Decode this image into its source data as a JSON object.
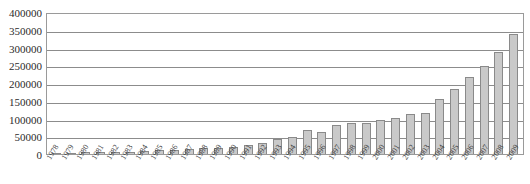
{
  "chart_data": {
    "type": "bar",
    "title": "",
    "xlabel": "",
    "ylabel": "",
    "ylim": [
      0,
      400000
    ],
    "ytick_step": 50000,
    "yticks": [
      "400000",
      "350000",
      "300000",
      "250000",
      "200000",
      "150000",
      "100000",
      "50000",
      "0"
    ],
    "grid": true,
    "legend": "none",
    "bar_color": "#c9c9c9",
    "bar_border_color": "#8a8a8a",
    "gridline_color": "#8c8c8c",
    "axis_color": "#9a9a9a",
    "categories": [
      "1978",
      "1979",
      "1980",
      "1981",
      "1982",
      "1983",
      "1984",
      "1985",
      "1986",
      "1987",
      "1988",
      "1989",
      "1990",
      "1991",
      "1992",
      "1993",
      "1994",
      "1995",
      "1996",
      "1997",
      "1998",
      "1999",
      "2000",
      "2001",
      "2002",
      "2003",
      "2004",
      "2005",
      "2006",
      "2007",
      "2008",
      "2009"
    ],
    "values": [
      3000,
      4000,
      6000,
      5000,
      7000,
      6000,
      9000,
      11000,
      10000,
      13000,
      17000,
      16000,
      21000,
      26000,
      32000,
      43000,
      49000,
      68000,
      62000,
      83000,
      86000,
      88000,
      97000,
      101000,
      113000,
      116000,
      156000,
      184000,
      216000,
      248000,
      287000,
      338000
    ]
  }
}
